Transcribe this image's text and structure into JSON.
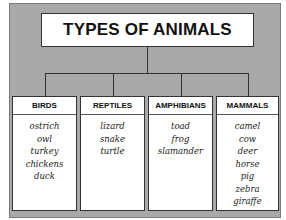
{
  "title": "TYPES OF ANIMALS",
  "categories": [
    {
      "name": "BIRDS",
      "items": [
        "ostrich",
        "owl",
        "turkey",
        "chickens",
        "duck"
      ]
    },
    {
      "name": "REPTILES",
      "items": [
        "lizard",
        "snake",
        "turtle"
      ]
    },
    {
      "name": "AMPHIBIANS",
      "items": [
        "toad",
        "frog",
        "slamander"
      ]
    },
    {
      "name": "MAMMALS",
      "items": [
        "camel",
        "cow",
        "deer",
        "horse",
        "pig",
        "zebra",
        "giraffe"
      ]
    }
  ]
}
